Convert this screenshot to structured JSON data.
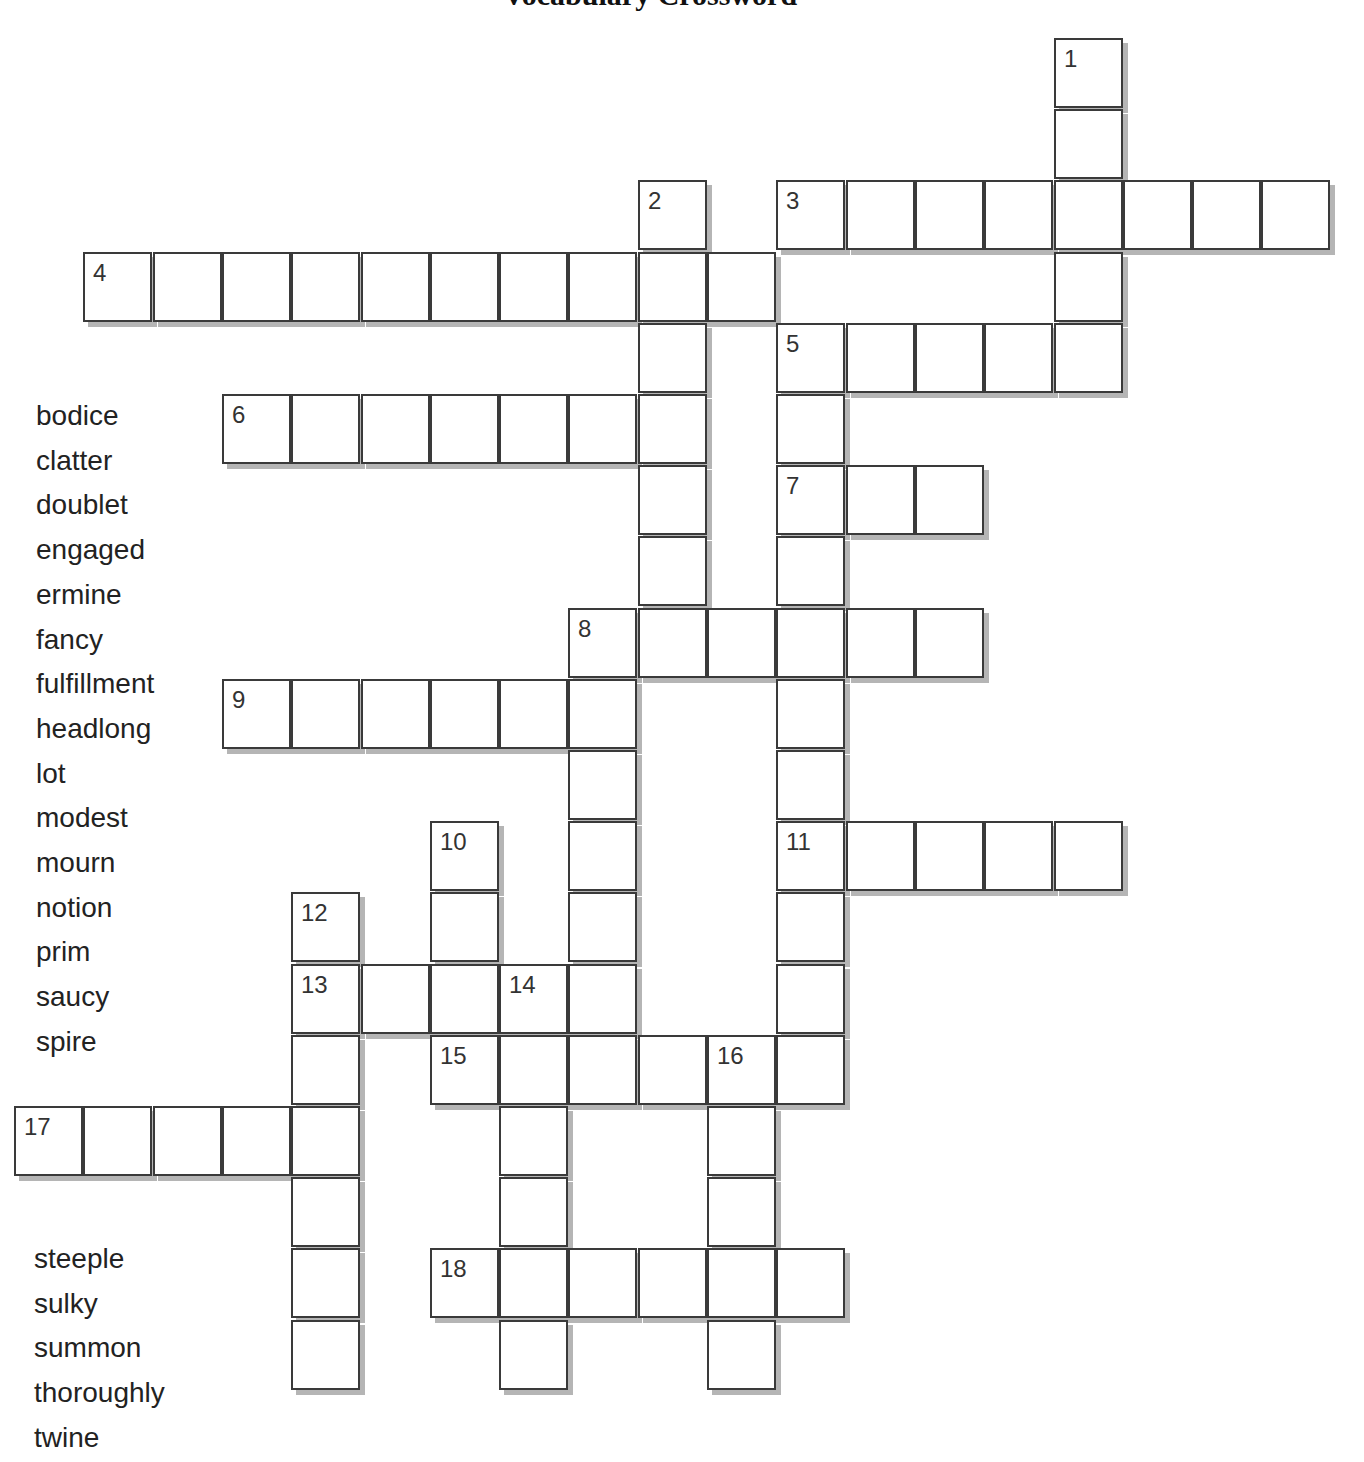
{
  "title": "Vocabulary Crossword",
  "grid": {
    "origin_x": 14,
    "origin_y": 38,
    "cell_w": 69.3,
    "cell_h": 71.2,
    "entries": [
      {
        "number": "1",
        "direction": "down",
        "col": 15,
        "row": 0,
        "length": 5
      },
      {
        "number": "2",
        "direction": "down",
        "col": 9,
        "row": 2,
        "length": 7
      },
      {
        "number": "3",
        "direction": "across",
        "col": 11,
        "row": 2,
        "length": 8
      },
      {
        "number": "4",
        "direction": "across",
        "col": 1,
        "row": 3,
        "length": 10
      },
      {
        "number": "5",
        "direction": "across",
        "col": 11,
        "row": 4,
        "length": 5
      },
      {
        "number": "5",
        "direction": "down",
        "col": 11,
        "row": 4,
        "length": 11
      },
      {
        "number": "6",
        "direction": "across",
        "col": 3,
        "row": 5,
        "length": 7
      },
      {
        "number": "7",
        "direction": "across",
        "col": 11,
        "row": 6,
        "length": 3
      },
      {
        "number": "8",
        "direction": "across",
        "col": 8,
        "row": 8,
        "length": 6
      },
      {
        "number": "8",
        "direction": "down",
        "col": 8,
        "row": 8,
        "length": 6
      },
      {
        "number": "9",
        "direction": "across",
        "col": 3,
        "row": 9,
        "length": 6
      },
      {
        "number": "10",
        "direction": "down",
        "col": 6,
        "row": 11,
        "length": 4
      },
      {
        "number": "11",
        "direction": "across",
        "col": 11,
        "row": 11,
        "length": 5
      },
      {
        "number": "12",
        "direction": "down",
        "col": 4,
        "row": 12,
        "length": 7
      },
      {
        "number": "13",
        "direction": "across",
        "col": 4,
        "row": 13,
        "length": 5
      },
      {
        "number": "14",
        "direction": "down",
        "col": 7,
        "row": 13,
        "length": 6
      },
      {
        "number": "15",
        "direction": "across",
        "col": 6,
        "row": 14,
        "length": 6
      },
      {
        "number": "16",
        "direction": "down",
        "col": 10,
        "row": 14,
        "length": 5
      },
      {
        "number": "17",
        "direction": "across",
        "col": 0,
        "row": 15,
        "length": 5
      },
      {
        "number": "18",
        "direction": "across",
        "col": 6,
        "row": 17,
        "length": 6
      }
    ]
  },
  "word_bank": {
    "top": [
      "bodice",
      "clatter",
      "doublet",
      "engaged",
      "ermine",
      "fancy",
      "fulfillment",
      "headlong",
      "lot",
      "modest",
      "mourn",
      "notion",
      "prim",
      "saucy",
      "spire"
    ],
    "bottom": [
      "steeple",
      "sulky",
      "summon",
      "thoroughly",
      "twine"
    ]
  }
}
